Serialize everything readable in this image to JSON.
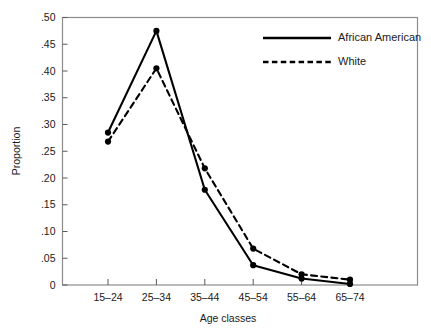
{
  "chart_data": {
    "type": "line",
    "title": "",
    "xlabel": "Age classes",
    "ylabel": "Proportion",
    "categories": [
      "15–24",
      "25–34",
      "35–44",
      "45–54",
      "55–64",
      "65–74"
    ],
    "series": [
      {
        "name": "African American",
        "style": "solid",
        "color": "#000000",
        "values": [
          0.285,
          0.475,
          0.178,
          0.037,
          0.012,
          0.002
        ]
      },
      {
        "name": "White",
        "style": "dashed",
        "color": "#000000",
        "values": [
          0.268,
          0.405,
          0.218,
          0.068,
          0.02,
          0.01
        ]
      }
    ],
    "ylim": [
      0,
      0.5
    ],
    "ytick_values": [
      0,
      0.05,
      0.1,
      0.15,
      0.2,
      0.25,
      0.3,
      0.35,
      0.4,
      0.45,
      0.5
    ],
    "ytick_labels": [
      "0",
      ".05",
      ".10",
      ".15",
      ".20",
      ".25",
      ".30",
      ".35",
      ".40",
      ".45",
      ".50"
    ],
    "grid": false,
    "legend_position": "top-right",
    "legend": [
      {
        "label": "African American",
        "style": "solid"
      },
      {
        "label": "White",
        "style": "dashed"
      }
    ]
  },
  "axes": {
    "y_title": "Proportion",
    "x_title": "Age classes"
  },
  "colors": {
    "background": "#ffffff",
    "frame": "#8c8c8c",
    "ink": "#000000",
    "text": "#1a1a1a"
  }
}
